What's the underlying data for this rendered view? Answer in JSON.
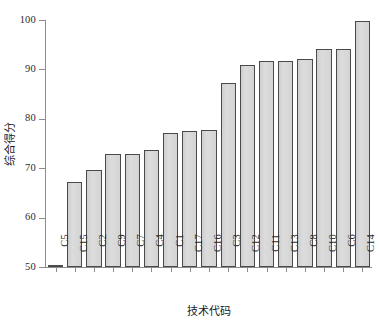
{
  "chart_data": {
    "type": "bar",
    "title": "",
    "subtitle": "",
    "xlabel": "技术代码",
    "ylabel": "综合得分",
    "categories": [
      "C5",
      "C15",
      "C2",
      "C9",
      "C7",
      "C4",
      "C1",
      "C17",
      "C16",
      "C3",
      "C12",
      "C11",
      "C13",
      "C8",
      "C10",
      "C6",
      "C14"
    ],
    "values": [
      50.3,
      67.2,
      69.7,
      72.8,
      72.8,
      73.7,
      77.2,
      77.5,
      77.8,
      87.2,
      90.8,
      91.8,
      91.8,
      92.1,
      94.2,
      94.2,
      99.9
    ],
    "ylim": [
      50,
      100
    ],
    "yticks": [
      50,
      60,
      70,
      80,
      90,
      100
    ],
    "ytick_labels": [
      "50",
      "60",
      "70",
      "80",
      "90",
      "100"
    ],
    "xtick_rotation": -90,
    "grid": false,
    "legend": false,
    "legend_position": "none",
    "bar_fill": "#d6d6d6",
    "bar_edge": "#4a4a4a",
    "axis_color": "#8c8c8c",
    "text_color": "#2b2b2b",
    "background": "#ffffff"
  }
}
